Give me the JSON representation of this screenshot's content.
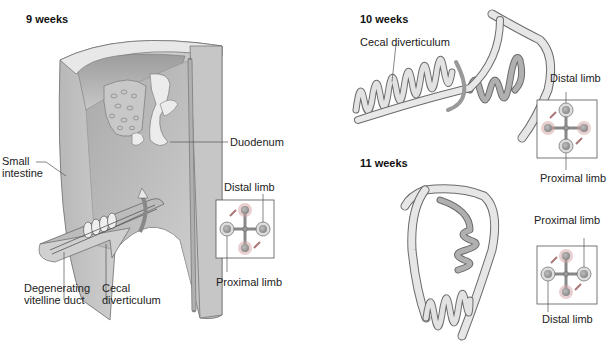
{
  "panels": [
    {
      "id": "9-weeks",
      "title": "9 weeks",
      "labels": {
        "duodenum": "Duodenum",
        "small_intestine": "Small\nintestine",
        "degenerating_vitelline_duct": "Degenerating\nvitelline duct",
        "cecal_diverticulum": "Cecal\ndiverticulum"
      },
      "inset": {
        "top_label": "Distal limb",
        "bottom_label": "Proximal limb"
      }
    },
    {
      "id": "10-weeks",
      "title": "10 weeks",
      "labels": {
        "cecal_diverticulum": "Cecal diverticulum"
      },
      "inset": {
        "top_label": "Distal limb",
        "bottom_label": "Proximal limb"
      }
    },
    {
      "id": "11-weeks",
      "title": "11 weeks",
      "labels": {},
      "inset": {
        "top_label": "Proximal limb",
        "bottom_label": "Distal limb"
      }
    }
  ],
  "colors": {
    "wall_light": "#d9d9d9",
    "wall_mid": "#bdbdbd",
    "wall_dark": "#9a9a9a",
    "gut_light": "#e6e6e6",
    "gut_dark": "#a8a8a8",
    "outline": "#6b6b6b",
    "inset_border": "#555555"
  }
}
